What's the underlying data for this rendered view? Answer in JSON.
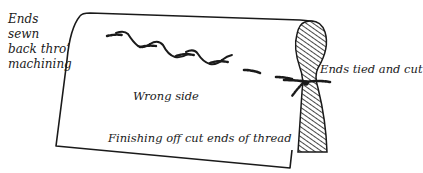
{
  "diagram": {
    "title": "Finishing off cut ends of thread",
    "labels": {
      "ends_sewn": "Ends sewn back thro’ machining",
      "ends_tied": "Ends tied and cut",
      "wrong_side": "Wrong side",
      "caption": "Finishing off cut ends of thread"
    },
    "icons": {
      "fabric": "folded-fabric-illustration",
      "stitching": "wavy-machine-stitch-line",
      "knot": "thread-knot",
      "fold": "hatched-fabric-fold"
    },
    "colors": {
      "ink": "#1a1a1a",
      "background": "#ffffff"
    }
  }
}
